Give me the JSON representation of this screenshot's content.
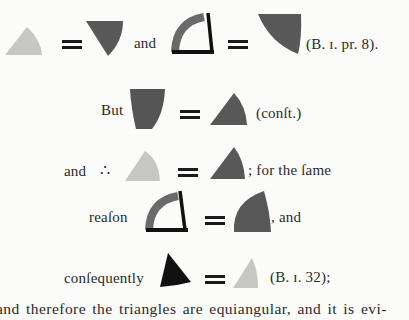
{
  "colors": {
    "light": "#c6c6c4",
    "dark": "#585858",
    "black": "#111111",
    "page": "#fbfbf9"
  },
  "rows": [
    {
      "id": "row1",
      "items": [
        {
          "type": "shape",
          "name": "light-triangle-icon",
          "color": "light"
        },
        {
          "type": "equals"
        },
        {
          "type": "shape",
          "name": "dark-inverted-triangle-icon",
          "color": "dark"
        },
        {
          "type": "text",
          "value": "and"
        },
        {
          "type": "shape",
          "name": "arc-angle-icon",
          "color": "dark"
        },
        {
          "type": "equals"
        },
        {
          "type": "shape",
          "name": "dark-inverted-sector-icon",
          "color": "dark"
        },
        {
          "type": "text",
          "value": "(B. 1. pr. 8)."
        }
      ]
    },
    {
      "id": "row2",
      "items": [
        {
          "type": "text",
          "value": "But"
        },
        {
          "type": "shape",
          "name": "dark-inverted-sector-icon",
          "color": "dark"
        },
        {
          "type": "equals"
        },
        {
          "type": "shape",
          "name": "dark-triangle-icon",
          "color": "dark"
        },
        {
          "type": "text",
          "value": "(conft.)"
        }
      ]
    },
    {
      "id": "row3",
      "items": [
        {
          "type": "text",
          "value": "and"
        },
        {
          "type": "text",
          "value": "∴"
        },
        {
          "type": "shape",
          "name": "light-sector-icon",
          "color": "light"
        },
        {
          "type": "equals"
        },
        {
          "type": "shape",
          "name": "dark-triangle-icon",
          "color": "dark"
        },
        {
          "type": "text",
          "value": "; for the fame"
        }
      ]
    },
    {
      "id": "row4",
      "items": [
        {
          "type": "text",
          "value": "reafon"
        },
        {
          "type": "shape",
          "name": "arc-angle-icon",
          "color": "dark"
        },
        {
          "type": "equals"
        },
        {
          "type": "shape",
          "name": "dark-sector-icon",
          "color": "dark"
        },
        {
          "type": "text",
          "value": ", and"
        }
      ]
    },
    {
      "id": "row5",
      "items": [
        {
          "type": "text",
          "value": "confequently"
        },
        {
          "type": "shape",
          "name": "black-triangle-icon",
          "color": "black"
        },
        {
          "type": "equals"
        },
        {
          "type": "shape",
          "name": "light-narrow-triangle-icon",
          "color": "light"
        },
        {
          "type": "text",
          "value": "(B. 1. 32);"
        }
      ]
    }
  ],
  "text": {
    "row1_and": "and",
    "row1_ref": "(B. ɪ. pr. 8).",
    "row2_but": "But",
    "row2_ref": "(conſt.)",
    "row3_and": "and",
    "row3_therefore": "∴",
    "row3_tail": "; for the ſame",
    "row4_reason": "reaſon",
    "row4_tail": ", and",
    "row5_consequently": "conſequently",
    "row5_ref": "(B. ɪ. 32);",
    "row6_line": "and therefore the triangles are equiangular, and it is evi-"
  }
}
